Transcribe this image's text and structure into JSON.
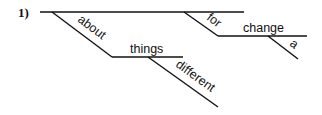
{
  "diagram": {
    "type": "sentence-diagram",
    "number": "1)",
    "words": {
      "about": "about",
      "things": "things",
      "different": "different",
      "for": "for",
      "change": "change",
      "a": "a"
    }
  }
}
